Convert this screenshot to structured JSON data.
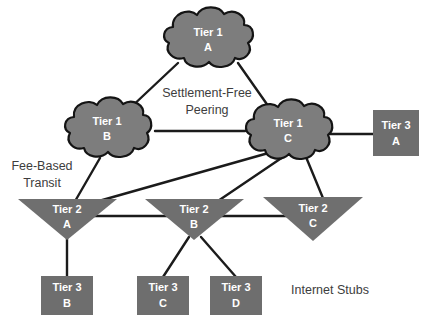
{
  "diagram": {
    "colors": {
      "cloud_fill": "#7d7d7d",
      "cloud_stroke": "#141414",
      "triangle_fill": "#6f6f6f",
      "box_fill": "#6e6e6e",
      "link": "#1b1b1b",
      "node_text": "#ffffff",
      "annotation_text": "#3d3d3d",
      "background": "#ffffff"
    },
    "clouds": [
      {
        "id": "tier1-a",
        "tier": "Tier 1",
        "name": "A",
        "cx": 208,
        "cy": 42
      },
      {
        "id": "tier1-b",
        "tier": "Tier 1",
        "name": "B",
        "cx": 107,
        "cy": 131
      },
      {
        "id": "tier1-c",
        "tier": "Tier 1",
        "name": "C",
        "cx": 288,
        "cy": 133
      }
    ],
    "triangles": [
      {
        "id": "tier2-a",
        "tier": "Tier 2",
        "name": "A",
        "cx": 67,
        "cy": 212
      },
      {
        "id": "tier2-b",
        "tier": "Tier 2",
        "name": "B",
        "cx": 194,
        "cy": 212
      },
      {
        "id": "tier2-c",
        "tier": "Tier 2",
        "name": "C",
        "cx": 313,
        "cy": 212
      }
    ],
    "boxes": [
      {
        "id": "tier3-a",
        "tier": "Tier 3",
        "name": "A",
        "cx": 396,
        "cy": 134
      },
      {
        "id": "tier3-b",
        "tier": "Tier 3",
        "name": "B",
        "cx": 67,
        "cy": 292
      },
      {
        "id": "tier3-c",
        "tier": "Tier 3",
        "name": "C",
        "cx": 163,
        "cy": 292
      },
      {
        "id": "tier3-d",
        "tier": "Tier 3",
        "name": "D",
        "cx": 236,
        "cy": 292
      }
    ],
    "annotations": [
      {
        "id": "settlement-free-peering",
        "line1": "Settlement-Free",
        "line2": "Peering",
        "x": 207,
        "y": 97
      },
      {
        "id": "fee-based-transit",
        "line1": "Fee-Based",
        "line2": "Transit",
        "x": 42,
        "y": 170
      },
      {
        "id": "internet-stubs",
        "line1": "Internet Stubs",
        "line2": "",
        "x": 330,
        "y": 294
      }
    ],
    "links": [
      {
        "from": "tier1-a",
        "to": "tier1-b",
        "type": "peering"
      },
      {
        "from": "tier1-a",
        "to": "tier1-c",
        "type": "peering"
      },
      {
        "from": "tier1-b",
        "to": "tier1-c",
        "type": "peering"
      },
      {
        "from": "tier1-c",
        "to": "tier3-a",
        "type": "transit"
      },
      {
        "from": "tier1-b",
        "to": "tier2-a",
        "type": "transit"
      },
      {
        "from": "tier1-c",
        "to": "tier2-a",
        "type": "transit"
      },
      {
        "from": "tier1-c",
        "to": "tier2-b",
        "type": "transit"
      },
      {
        "from": "tier1-c",
        "to": "tier2-c",
        "type": "transit"
      },
      {
        "from": "tier2-a",
        "to": "tier2-b",
        "type": "peering"
      },
      {
        "from": "tier2-b",
        "to": "tier2-c",
        "type": "peering"
      },
      {
        "from": "tier2-a",
        "to": "tier3-b",
        "type": "transit"
      },
      {
        "from": "tier2-b",
        "to": "tier3-c",
        "type": "transit"
      },
      {
        "from": "tier2-b",
        "to": "tier3-d",
        "type": "transit"
      }
    ]
  }
}
